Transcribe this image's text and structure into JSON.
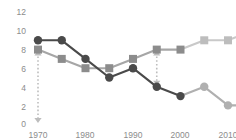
{
  "chart_data": {
    "type": "line",
    "title": "",
    "subtitle": "",
    "xlabel": "",
    "ylabel": "",
    "x": [
      1970,
      1975,
      1980,
      1985,
      1990,
      1995,
      2000,
      2005,
      2010,
      2015
    ],
    "xlim": [
      1967,
      2017
    ],
    "ylim": [
      0,
      12
    ],
    "xticks": [
      1970,
      1980,
      1990,
      2000,
      2010
    ],
    "xtick_labels": [
      "1970",
      "1980",
      "1990",
      "2000",
      "2010"
    ],
    "yticks": [
      0,
      2,
      4,
      6,
      8,
      10,
      12
    ],
    "ytick_labels": [
      "0",
      "2",
      "4",
      "6",
      "8",
      "10",
      "12"
    ],
    "grid": false,
    "legend": "none",
    "series": [
      {
        "name": "circle-series",
        "marker": "circle",
        "color": "#4a4a4a",
        "fade_color": "#b0b0b0",
        "values": [
          9,
          9,
          7,
          5,
          6,
          4,
          3,
          4,
          2,
          2
        ],
        "fade_from_index": 7
      },
      {
        "name": "square-series",
        "marker": "square",
        "color": "#8c8c8c",
        "fade_color": "#bdbdbd",
        "values": [
          8,
          7,
          6,
          6,
          7,
          8,
          8,
          9,
          9,
          10
        ],
        "fade_from_index": 7
      }
    ],
    "annotations": [
      {
        "name": "gap-arrow-1970",
        "kind": "double-headed-dotted-arrow",
        "x": 1970,
        "y_top": 8,
        "y_bottom": 0,
        "color": "#bdbdbd",
        "label": ""
      },
      {
        "name": "gap-arrow-1995",
        "kind": "double-headed-dotted-arrow",
        "x": 1995,
        "y_top": 8,
        "y_bottom": 4,
        "color": "#bdbdbd",
        "label": ""
      }
    ]
  },
  "axis": {
    "ytick_0": "0",
    "ytick_2": "2",
    "ytick_4": "4",
    "ytick_6": "6",
    "ytick_8": "8",
    "ytick_10": "10",
    "ytick_12": "12",
    "xtick_1970": "1970",
    "xtick_1980": "1980",
    "xtick_1990": "1990",
    "xtick_2000": "2000",
    "xtick_2010": "2010"
  },
  "colors": {
    "tick_text": "#8c8c8c",
    "series_a_dark": "#4a4a4a",
    "series_a_light": "#b0b0b0",
    "series_b_dark": "#8c8c8c",
    "series_b_light": "#bdbdbd",
    "annotation": "#bdbdbd",
    "background": "#ffffff"
  }
}
